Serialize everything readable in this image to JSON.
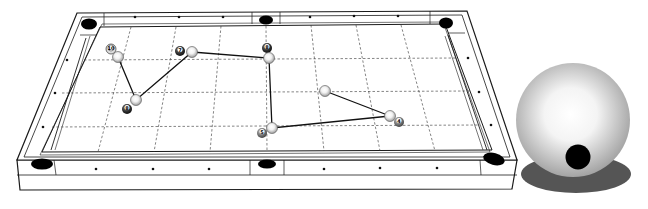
{
  "diagram": {
    "title": "",
    "type": "billiards-shot-path",
    "table": {
      "cloth_color": "#ffffff",
      "line_color": "#1a1a1a",
      "pocket_color": "#000000",
      "grid_style": "dashed"
    },
    "balls": [
      {
        "id": "ball-10",
        "number": "10",
        "x": 111,
        "y": 48,
        "style": "striped"
      },
      {
        "id": "ball-7",
        "number": "7",
        "x": 180,
        "y": 50,
        "style": "solid"
      },
      {
        "id": "ball-8a",
        "number": "8",
        "x": 267,
        "y": 47,
        "style": "solid"
      },
      {
        "id": "ball-8b",
        "number": "8",
        "x": 127,
        "y": 108,
        "style": "solid"
      },
      {
        "id": "ball-5",
        "number": "5",
        "x": 262,
        "y": 132,
        "style": "solid"
      },
      {
        "id": "ball-4",
        "number": "4",
        "x": 399,
        "y": 121,
        "style": "solid"
      }
    ],
    "cue_ball_positions": [
      {
        "x": 118,
        "y": 57
      },
      {
        "x": 136,
        "y": 100
      },
      {
        "x": 192,
        "y": 52
      },
      {
        "x": 269,
        "y": 58
      },
      {
        "x": 272,
        "y": 128
      },
      {
        "x": 390,
        "y": 116
      },
      {
        "x": 325,
        "y": 91
      }
    ],
    "path": [
      [
        118,
        57
      ],
      [
        136,
        100
      ],
      [
        192,
        52
      ],
      [
        269,
        58
      ],
      [
        272,
        128
      ],
      [
        390,
        116
      ],
      [
        325,
        91
      ]
    ],
    "cue_ball_inset": {
      "label": "cue-ball-tip-position",
      "center_x": 573,
      "center_y": 120,
      "radius": 57,
      "tip_x": 578,
      "tip_y": 157,
      "tip_radius": 12,
      "shadow_color": "#555555"
    }
  }
}
